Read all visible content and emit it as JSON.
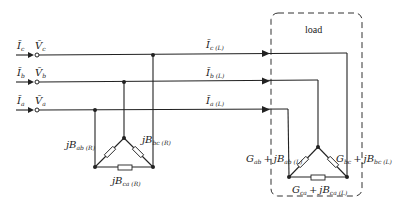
{
  "diagram": {
    "type": "three-phase circuit with delta-connected reactive compensator and delta-connected load",
    "load_box": {
      "label": "load"
    },
    "sources": [
      {
        "phase": "c",
        "current": "Ī",
        "current_sub": "c",
        "voltage": "V̄",
        "voltage_sub": "c"
      },
      {
        "phase": "b",
        "current": "Ī",
        "current_sub": "b",
        "voltage": "V̄",
        "voltage_sub": "b"
      },
      {
        "phase": "a",
        "current": "Ī",
        "current_sub": "a",
        "voltage": "V̄",
        "voltage_sub": "a"
      }
    ],
    "load_currents": [
      {
        "phase": "c",
        "main": "Ī",
        "sub": "c (L)"
      },
      {
        "phase": "b",
        "main": "Ī",
        "sub": "b (L)"
      },
      {
        "phase": "a",
        "main": "Ī",
        "sub": "a (L)"
      }
    ],
    "compensator": {
      "ab": {
        "main": "jB",
        "sub": "ab (R)"
      },
      "bc": {
        "main": "jB",
        "sub": "bc (R)"
      },
      "ca": {
        "main": "jB",
        "sub": "ca (R)"
      }
    },
    "load_branches": {
      "ab": {
        "g": "G",
        "g_sub": "ab",
        "plus": "+",
        "b": "jB",
        "b_sub": "ab (L)"
      },
      "bc": {
        "g": "G",
        "g_sub": "bc",
        "plus": "+",
        "b": "jB",
        "b_sub": "bc (L)"
      },
      "ca": {
        "g": "G",
        "g_sub": "ca",
        "plus": "+",
        "b": "jB",
        "b_sub": "ca (L)"
      }
    }
  }
}
